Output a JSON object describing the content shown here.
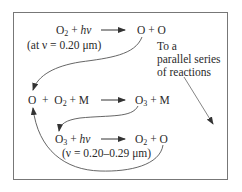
{
  "diagram": {
    "type": "reaction-cycle",
    "reactions": [
      {
        "id": "photodissociation_o2",
        "reactants": {
          "species": "O",
          "subscript": "2",
          "plus": "+",
          "photon": "hν"
        },
        "arrow": "→",
        "products": "O + O",
        "condition": "(at ν = 0.20 μm)"
      },
      {
        "id": "ozone_formation",
        "reactants": {
          "a": "O",
          "plus1": "+",
          "species": "O",
          "subscript": "2",
          "rest": "+ M"
        },
        "arrow": "→",
        "products": {
          "species": "O",
          "subscript": "3",
          "rest": "+ M"
        }
      },
      {
        "id": "photodissociation_o3",
        "reactants": {
          "species": "O",
          "subscript": "3",
          "plus": "+",
          "photon": "hν"
        },
        "arrow": "→",
        "products": {
          "species": "O",
          "subscript": "2",
          "rest": "+ O"
        },
        "condition": "(ν = 0.20–0.29 μm)"
      }
    ],
    "side_note": {
      "line1": "To a",
      "line2": "parallel series",
      "line3": "of reactions"
    },
    "colors": {
      "text": "#2a2a2a",
      "lines": "#555555",
      "border": "#777777",
      "background": "#ffffff"
    }
  }
}
